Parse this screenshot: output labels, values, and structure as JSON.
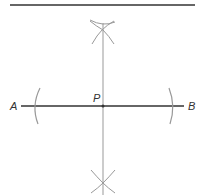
{
  "diagram": {
    "labels": {
      "a": "A",
      "b": "B",
      "p": "P"
    },
    "colors": {
      "main_line": "#333333",
      "construction": "#999999"
    }
  }
}
